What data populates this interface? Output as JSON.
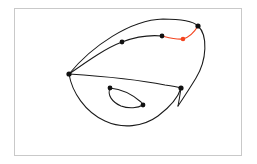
{
  "figure": {
    "background_color": "#ffffff",
    "frame": {
      "name": "plot-border",
      "color": "#c9c9c9",
      "x": 14,
      "y": 8,
      "width": 228,
      "height": 148
    },
    "colors": {
      "stroke": "#1a1a1a",
      "highlight": "#f4441f",
      "node": "#111111",
      "frame": "#c9c9c9"
    }
  },
  "chart_data": {
    "type": "diagram",
    "title": "",
    "xlabel": "",
    "ylabel": "",
    "grid": false,
    "legend": null,
    "xlim": [
      0,
      257
    ],
    "ylim": [
      164,
      0
    ],
    "nodes": [
      {
        "id": "v-left",
        "x": 69,
        "y": 74,
        "color": "#111111",
        "size": 2.6
      },
      {
        "id": "v-upper-mid",
        "x": 122,
        "y": 42,
        "color": "#111111",
        "size": 2.4
      },
      {
        "id": "v-chord-mid",
        "x": 162,
        "y": 36,
        "color": "#111111",
        "size": 2.4
      },
      {
        "id": "v-red-mid",
        "x": 183,
        "y": 39,
        "color": "#f4441f",
        "size": 2.3
      },
      {
        "id": "v-top-right",
        "x": 198,
        "y": 26,
        "color": "#111111",
        "size": 2.6
      },
      {
        "id": "v-right",
        "x": 181,
        "y": 88,
        "color": "#111111",
        "size": 2.6
      },
      {
        "id": "v-loop-top",
        "x": 110,
        "y": 88,
        "color": "#111111",
        "size": 2.4
      },
      {
        "id": "v-loop-bottom",
        "x": 143,
        "y": 105,
        "color": "#111111",
        "size": 2.4
      }
    ],
    "edges": [
      {
        "id": "outer-upper-arc",
        "color": "#1a1a1a",
        "path": "M 69 74 C 92 46, 130 20, 163 19 C 182 19, 194 22, 198 26"
      },
      {
        "id": "right-descending-arc",
        "color": "#1a1a1a",
        "path": "M 198 26 C 208 35, 207 60, 196 78 C 190 88, 184 97, 178 106"
      },
      {
        "id": "chord-left-to-mid",
        "color": "#1a1a1a",
        "path": "M 69 74 C 89 60, 106 48, 122 42 C 138 36, 152 35, 162 36"
      },
      {
        "id": "highlight-red-arc",
        "color": "#f4441f",
        "path": "M 162 36 C 170 38, 177 40, 183 39 C 190 37, 195 31, 198 26"
      },
      {
        "id": "inner-sweep-left-to-right",
        "color": "#1a1a1a",
        "path": "M 69 74 C 100 76, 140 80, 165 85 C 173 86, 178 87, 181 88"
      },
      {
        "id": "lower-outer-left",
        "color": "#1a1a1a",
        "path": "M 69 74 C 72 92, 85 112, 105 121 C 122 129, 143 127, 158 116 C 170 107, 178 98, 181 88"
      },
      {
        "id": "right-node-join",
        "color": "#1a1a1a",
        "path": "M 181 88 C 180 95, 179 101, 178 106"
      },
      {
        "id": "inner-loop-upper",
        "color": "#1a1a1a",
        "path": "M 110 88 C 121 89, 133 95, 141 102 C 142 103, 143 104, 143 105"
      },
      {
        "id": "inner-loop-lower",
        "color": "#1a1a1a",
        "path": "M 110 88 C 107 95, 112 102, 121 106 C 129 109, 138 108, 143 105"
      }
    ]
  }
}
